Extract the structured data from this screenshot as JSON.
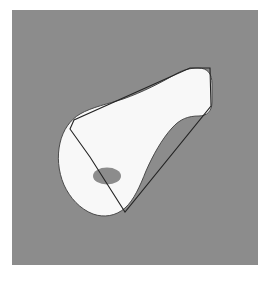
{
  "figure": {
    "caption": "",
    "canvas": {
      "width": 275,
      "height": 281,
      "page_background": "#ffffff"
    },
    "panel": {
      "x": 12,
      "y": 10,
      "width": 246,
      "height": 255,
      "background_color": "#8c8c8c",
      "label": "figure panel"
    },
    "colors": {
      "background_gray": "#8c8c8c",
      "shape_fill": "#f8f8f8",
      "outline_stroke": "#242424",
      "shape_edge_stroke": "#4a4a4a",
      "marker_fill": "#8c8c8c"
    },
    "shapes": [
      {
        "name": "hull-outline",
        "type": "polygon",
        "description": "thin straight-edged hull drawn around the solid",
        "stroke": "#242424",
        "stroke_width": 1.1,
        "fill": "none",
        "points": "178,58 198,58 199,96 113,202 78,147 58,119 62,110"
      },
      {
        "name": "solid-body",
        "type": "path",
        "description": "white tapered solid with bulbous left end and concave waist",
        "fill": "#f8f8f8",
        "stroke": "#4a4a4a",
        "stroke_width": 1.0,
        "d": "M 186,58 C 196,58 200,64 200,74 L 200,92 C 200,101 195,106 187,106 C 176,106 168,109 160,118 C 150,129 141,145 134,161 C 128,176 122,190 113,198 C 104,206 92,208 81,204 C 68,199 58,188 52,175 C 46,161 45,146 48,133 C 51,120 58,110 68,104 C 80,97 96,94 111,89 C 131,82 150,72 162,65 C 170,60 178,58 186,58 Z"
      },
      {
        "name": "interior-ellipse-marker",
        "type": "ellipse",
        "description": "gray oval marking on the bulbous end",
        "fill": "#8c8c8c",
        "cx": 95,
        "cy": 166,
        "rx": 14,
        "ry": 8.5
      }
    ],
    "annotations": []
  }
}
